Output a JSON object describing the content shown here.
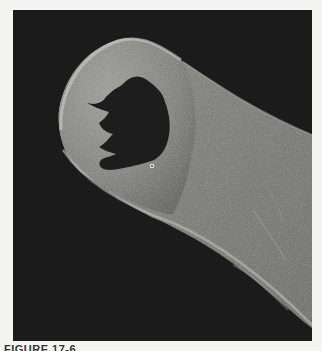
{
  "figure": {
    "caption_label": "FIGURE 17-6",
    "colors": {
      "background": "#1a1a1a",
      "specimen": "#8f8f8c",
      "specimen_edge": "#c4c4c0",
      "mouth": "#1c1c1c",
      "page": "#f4f4f2"
    }
  }
}
